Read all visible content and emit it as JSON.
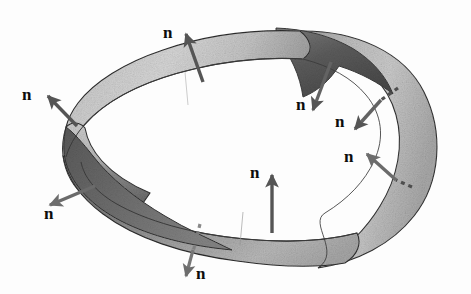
{
  "figure": {
    "background_color": "#fdfdfd",
    "surface": {
      "light_face_color": "#c9c9c9",
      "light_face_highlight": "#dcdcdc",
      "dark_face_color": "#6e6e6e",
      "dark_face_shadow": "#4f4f4f",
      "outline_color": "#2b2b2b",
      "texture": "grainy-halftone"
    },
    "vector": {
      "label": "n",
      "arrow_color": "#555555",
      "arrow_color_light": "#8a8a8a",
      "dashed_tail_color": "#777777",
      "label_color": "#0d0d0d",
      "count": 8
    },
    "normals": [
      {
        "id": "normal-top",
        "label": "n",
        "label_x": 163,
        "label_y": 24,
        "tail_x": 203,
        "tail_y": 82,
        "tip_x": 183,
        "tip_y": 28,
        "direction": "up-left",
        "side": "outward",
        "hidden_tail": false
      },
      {
        "id": "normal-upper-left",
        "label": "n",
        "label_x": 22,
        "label_y": 86,
        "tail_x": 77,
        "tail_y": 126,
        "tip_x": 44,
        "tip_y": 93,
        "direction": "up-left",
        "side": "outward",
        "hidden_tail": false
      },
      {
        "id": "normal-lower-left",
        "label": "n",
        "label_x": 44,
        "label_y": 213,
        "tail_x": 95,
        "tail_y": 186,
        "tip_x": 46,
        "tip_y": 207,
        "direction": "down-left",
        "side": "outward",
        "hidden_tail": false
      },
      {
        "id": "normal-bottom",
        "label": "n",
        "label_x": 196,
        "label_y": 269,
        "tail_x": 201,
        "tail_y": 228,
        "tip_x": 186,
        "tip_y": 276,
        "direction": "down",
        "side": "outward",
        "hidden_tail": true
      },
      {
        "id": "normal-inner-bottom",
        "label": "n",
        "label_x": 250,
        "label_y": 164,
        "tail_x": 272,
        "tail_y": 233,
        "tip_x": 272,
        "tip_y": 171,
        "direction": "up",
        "side": "inward",
        "hidden_tail": false
      },
      {
        "id": "normal-inner-upper-right",
        "label": "n",
        "label_x": 296,
        "label_y": 96,
        "tail_x": 331,
        "tail_y": 62,
        "tip_x": 315,
        "tip_y": 112,
        "direction": "down-left",
        "side": "inward",
        "hidden_tail": false
      },
      {
        "id": "normal-inner-right",
        "label": "n",
        "label_x": 335,
        "label_y": 113,
        "tail_x": 398,
        "tail_y": 88,
        "tip_x": 353,
        "tip_y": 131,
        "direction": "down-left",
        "side": "inward",
        "hidden_tail": true
      },
      {
        "id": "normal-inner-lower-right",
        "label": "n",
        "label_x": 344,
        "label_y": 152,
        "tail_x": 412,
        "tail_y": 187,
        "tip_x": 365,
        "tip_y": 152,
        "direction": "up-left",
        "side": "inward",
        "hidden_tail": true
      }
    ]
  }
}
